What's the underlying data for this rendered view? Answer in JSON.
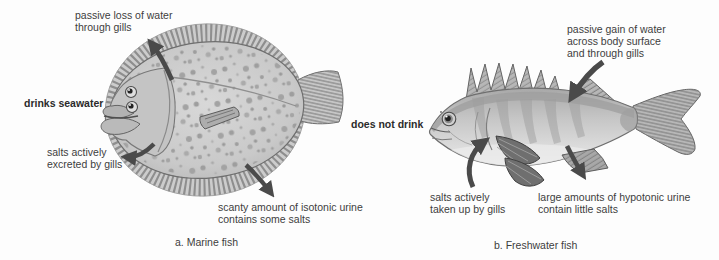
{
  "colors": {
    "background": "#fdfdfd",
    "text": "#3d3d3d",
    "text_bold": "#2b2b2b",
    "arrow": "#4a4a4a"
  },
  "marine": {
    "caption": "a. Marine fish",
    "label_passive_loss": [
      "passive loss of water",
      "through gills"
    ],
    "label_drinks": "drinks seawater",
    "label_salts": [
      "salts actively",
      "excreted by gills"
    ],
    "label_urine": [
      "scanty amount of isotonic urine",
      "contains some salts"
    ]
  },
  "freshwater": {
    "caption": "b. Freshwater fish",
    "label_passive_gain": [
      "passive gain of water",
      "across body surface",
      "and through gills"
    ],
    "label_drinks": "does not drink",
    "label_salts": [
      "salts actively",
      "taken up by gills"
    ],
    "label_urine": [
      "large amounts of hypotonic urine",
      "contain little salts"
    ]
  }
}
